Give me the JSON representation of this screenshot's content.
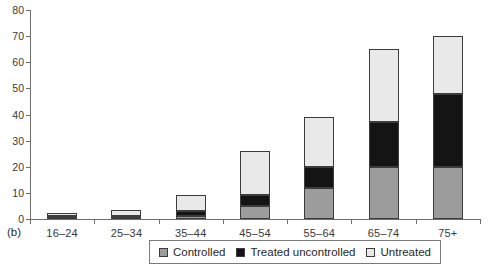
{
  "figure_label": "(b)",
  "colors": {
    "controlled": "#9c9c9c",
    "treated_uncontrolled": "#141414",
    "untreated": "#e9e9e9",
    "segment_border": "#3c3c3c",
    "axis": "#6e6e6e",
    "text": "#3a3a3a",
    "legend_border": "#7a7a7a",
    "background": "#ffffff"
  },
  "chart_data": {
    "type": "bar",
    "stacked": true,
    "title": "",
    "xlabel": "",
    "ylabel": "",
    "categories": [
      "16–24",
      "25–34",
      "35–44",
      "45–54",
      "55–64",
      "65–74",
      "75+"
    ],
    "series": [
      {
        "name": "Controlled",
        "color": "#9c9c9c",
        "values": [
          0.7,
          1.0,
          1.0,
          5.0,
          12.0,
          20.0,
          20.0
        ]
      },
      {
        "name": "Treated uncontrolled",
        "color": "#141414",
        "values": [
          0.3,
          0.3,
          2.0,
          4.0,
          8.0,
          17.0,
          28.0
        ]
      },
      {
        "name": "Untreated",
        "color": "#e9e9e9",
        "values": [
          1.2,
          2.0,
          6.0,
          17.0,
          19.0,
          28.0,
          22.0
        ]
      }
    ],
    "stack_totals": [
      2.2,
      3.3,
      9.0,
      26.0,
      39.0,
      65.0,
      70.0
    ],
    "ylim": [
      0,
      80
    ],
    "yticks": [
      0,
      10,
      20,
      30,
      40,
      50,
      60,
      70,
      80
    ],
    "grid": false,
    "legend_position": "bottom-center",
    "legend_boxed": true
  }
}
